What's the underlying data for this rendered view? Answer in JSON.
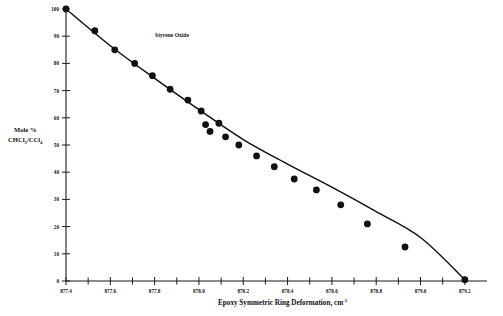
{
  "chart_data": {
    "type": "scatter",
    "title": "",
    "annotation": "Styrene Oxide",
    "xlabel_main": "Epoxy Symmetric Ring Deformation, cm",
    "xlabel_sup": "-1",
    "ylabel_line1": "Mole %",
    "ylabel_line2_pre": "CHCl",
    "ylabel_line2_sub1": "3",
    "ylabel_line2_mid": "/CCl",
    "ylabel_line2_sub2": "4",
    "xlabel_full": "Epoxy Symmetric Ring Deformation, cm-1",
    "ylabel_full": "Mole % CHCl3/CCl4",
    "xlim": [
      877.4,
      879.3
    ],
    "ylim": [
      0,
      100
    ],
    "xticks_major": [
      877.4,
      877.6,
      877.8,
      878.0,
      878.2,
      878.4,
      878.6,
      878.8,
      879.0,
      879.2
    ],
    "xticklabels": [
      "877.4",
      "877.6",
      "877.8",
      "878.0",
      "878.2",
      "878.4",
      "878.6",
      "878.8",
      "879.0",
      "879.2"
    ],
    "xtick_minor_step": 0.1,
    "yticks": [
      0,
      10,
      20,
      30,
      40,
      50,
      60,
      70,
      80,
      90,
      100
    ],
    "yticklabels": [
      "0",
      "10",
      "20",
      "30",
      "40",
      "50",
      "60",
      "70",
      "80",
      "90",
      "100"
    ],
    "grid": false,
    "legend": false,
    "x": [
      877.4,
      877.53,
      877.62,
      877.71,
      877.79,
      877.87,
      877.95,
      878.01,
      878.03,
      878.05,
      878.09,
      878.12,
      878.18,
      878.26,
      878.34,
      878.43,
      878.53,
      878.64,
      878.76,
      878.93,
      879.2
    ],
    "y": [
      100.0,
      92.0,
      85.0,
      80.0,
      75.5,
      70.5,
      66.5,
      62.5,
      57.5,
      55.0,
      58.0,
      53.0,
      50.0,
      46.0,
      42.0,
      37.5,
      33.5,
      28.0,
      21.0,
      12.5,
      0.5
    ],
    "series": [
      {
        "name": "Styrene Oxide",
        "marker": "filled-circle",
        "marker_color": "#111111",
        "line": "fitted-curve",
        "line_color": "#111111"
      }
    ],
    "fit_curve_points": [
      {
        "x": 877.4,
        "y": 100.0
      },
      {
        "x": 877.6,
        "y": 86.5
      },
      {
        "x": 877.8,
        "y": 74.5
      },
      {
        "x": 878.0,
        "y": 63.0
      },
      {
        "x": 878.2,
        "y": 52.0
      },
      {
        "x": 878.4,
        "y": 43.0
      },
      {
        "x": 878.6,
        "y": 34.5
      },
      {
        "x": 878.8,
        "y": 25.5
      },
      {
        "x": 879.0,
        "y": 16.0
      },
      {
        "x": 879.2,
        "y": 0.5
      }
    ]
  },
  "colors": {
    "background": "#ffffff",
    "ink": "#111111",
    "axis": "#1a1a1a"
  }
}
